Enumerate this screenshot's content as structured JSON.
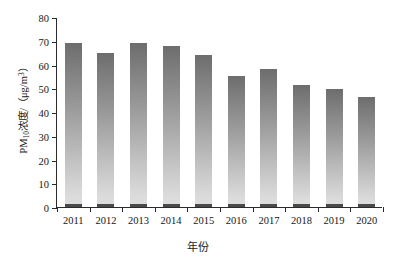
{
  "chart_data": {
    "type": "bar",
    "title": "",
    "subtitle": "",
    "xlabel": "年份",
    "ylabel": "PM10浓度/（μg/m3）",
    "ylabel_parts": {
      "prefix": "PM",
      "subscript": "10",
      "middle": "浓度/（μg/m",
      "superscript": "3",
      "suffix": "）"
    },
    "categories": [
      "2011",
      "2012",
      "2013",
      "2014",
      "2015",
      "2016",
      "2017",
      "2018",
      "2019",
      "2020"
    ],
    "values": [
      69,
      65,
      69,
      68,
      64,
      55,
      58,
      51.5,
      49.5,
      46.5
    ],
    "ylim": [
      0,
      80
    ],
    "ytick_labels": [
      "0",
      "10",
      "20",
      "30",
      "40",
      "50",
      "60",
      "70",
      "80"
    ],
    "ytick_values": [
      0,
      10,
      20,
      30,
      40,
      50,
      60,
      70,
      80
    ],
    "grid": false,
    "legend": null,
    "legend_position": "none",
    "bar_color_top": "#6d6d6d",
    "bar_color_bottom": "#dcdcdc",
    "bar_foot_color": "#4a4a4a",
    "axis_color": "#2b2b2b",
    "background_color": "#ffffff"
  }
}
